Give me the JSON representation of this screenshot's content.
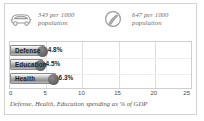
{
  "panel": {
    "background": "#ffffff",
    "frame_color": "#d3d3d3"
  },
  "stats": [
    {
      "icon": "car-icon",
      "value": "343",
      "text": "343 per 1000\npopulation"
    },
    {
      "icon": "telephone-icon",
      "value": "647",
      "text": "647 per 1000\npopulation"
    }
  ],
  "chart_data": {
    "type": "bar",
    "orientation": "horizontal",
    "title": "",
    "caption": "Defense, Health, Education spending as % of GDP",
    "categories": [
      "Defense",
      "Education",
      "Health"
    ],
    "values": [
      4.8,
      4.5,
      6.3
    ],
    "value_labels": [
      "4.8%",
      "4.5%",
      "6.3%"
    ],
    "xlabel": "",
    "ylabel": "",
    "xlim": [
      0,
      25
    ],
    "xticks": [
      0,
      5,
      10,
      15,
      20,
      25
    ],
    "xtick_labels": [
      "0",
      "5",
      "10",
      "15",
      "20",
      "25"
    ],
    "grid": true,
    "legend": false,
    "bar_color": "#a8a8a8",
    "marker_color": "#535353"
  }
}
